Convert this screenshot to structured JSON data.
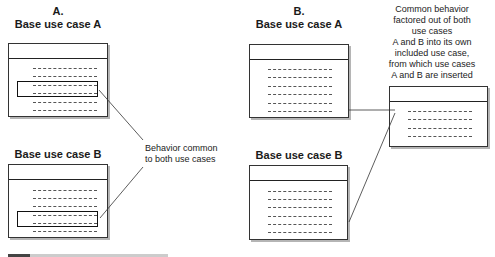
{
  "panel_a": {
    "label": "A.",
    "use_case_a_title": "Base use case A",
    "use_case_b_title": "Base use case B",
    "annotation": [
      "Behavior common",
      "to both use cases"
    ]
  },
  "panel_b": {
    "label": "B.",
    "use_case_a_title": "Base use case A",
    "use_case_b_title": "Base use case B",
    "annotation": [
      "Common behavior",
      "factored out of both",
      "use cases",
      "A and B into its own",
      "included use case,",
      "from which use cases",
      "A and B are inserted"
    ]
  },
  "caption": "FIGURE (partially cropped)"
}
